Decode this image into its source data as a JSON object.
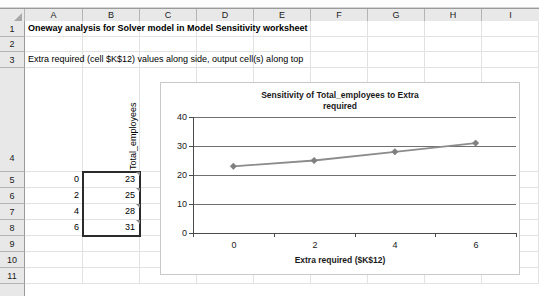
{
  "spreadsheet": {
    "column_headers": [
      "A",
      "B",
      "C",
      "D",
      "E",
      "F",
      "G",
      "H",
      "I"
    ],
    "row_headers": [
      "1",
      "2",
      "3",
      "4",
      "5",
      "6",
      "7",
      "8",
      "9",
      "10",
      "11"
    ],
    "cells": {
      "A1": "Oneway analysis for Solver model in Model Sensitivity worksheet",
      "A3": "Extra required (cell $K$12) values along side, output cell(s) along top",
      "B4": "Total_employees",
      "A5": "0",
      "B5": "23",
      "A6": "2",
      "B6": "25",
      "A7": "4",
      "B7": "28",
      "A8": "6",
      "B8": "31"
    }
  },
  "chart_data": {
    "type": "line",
    "title": "Sensitivity of Total_employees to Extra required",
    "title_line1": "Sensitivity of Total_employees to Extra",
    "title_line2": "required",
    "xlabel": "Extra required ($K$12)",
    "ylabel": "",
    "x": [
      0,
      2,
      4,
      6
    ],
    "values": [
      23,
      25,
      28,
      31
    ],
    "series": [
      {
        "name": "Total_employees",
        "values": [
          23,
          25,
          28,
          31
        ]
      }
    ],
    "categories": [
      "0",
      "2",
      "4",
      "6"
    ],
    "xlim": [
      -1,
      7
    ],
    "ylim": [
      0,
      40
    ],
    "ytick_labels": [
      "0",
      "10",
      "20",
      "30",
      "40"
    ],
    "yticks": [
      0,
      10,
      20,
      30,
      40
    ],
    "xtick_labels": [
      "0",
      "2",
      "4",
      "6"
    ],
    "xticks": [
      0,
      2,
      4,
      6
    ],
    "grid": "horizontal",
    "legend": "none",
    "marker": "diamond",
    "line_color": "#8c8c8c",
    "marker_color": "#7f7f7f",
    "gridline_color": "#6f6f6f"
  },
  "theme": {
    "header_bg": "#e8e8e8",
    "grid_color": "#e2e2e2",
    "text_color": "#000000",
    "selection_border": "#2b2b2b"
  }
}
